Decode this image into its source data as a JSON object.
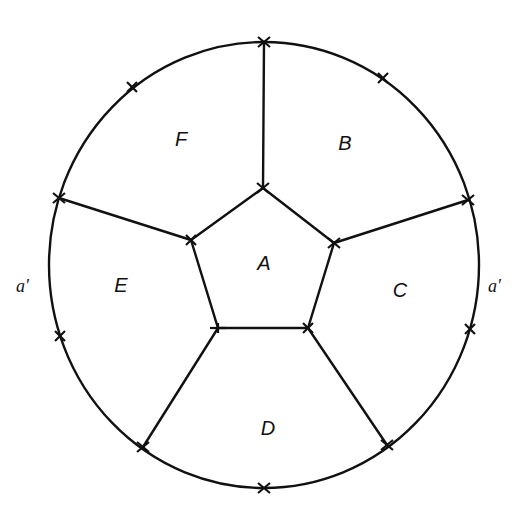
{
  "diagram": {
    "regions": [
      {
        "id": "A",
        "label": "A",
        "x": 264,
        "y": 270
      },
      {
        "id": "B",
        "label": "B",
        "x": 345,
        "y": 150
      },
      {
        "id": "C",
        "label": "C",
        "x": 400,
        "y": 297
      },
      {
        "id": "D",
        "label": "D",
        "x": 268,
        "y": 435
      },
      {
        "id": "E",
        "label": "E",
        "x": 121,
        "y": 292
      },
      {
        "id": "F",
        "label": "F",
        "x": 181,
        "y": 146
      }
    ],
    "side_labels": [
      {
        "id": "a-prime",
        "label": "a'",
        "x": 14,
        "y": 292
      },
      {
        "id": "a",
        "label": "a′",
        "x": 488,
        "y": 292
      }
    ],
    "colors": {
      "stroke": "#111111",
      "background": "#ffffff"
    }
  }
}
